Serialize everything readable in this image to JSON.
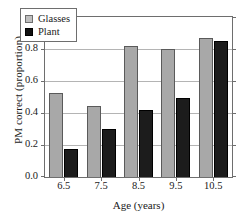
{
  "chart_data": {
    "type": "bar",
    "title": "",
    "xlabel": "Age (years)",
    "ylabel": "PM correct (proportion)",
    "categories": [
      "6.5",
      "7.5",
      "8.5",
      "9.5",
      "10.5"
    ],
    "series": [
      {
        "name": "Glasses",
        "color": "#a8a8a8",
        "values": [
          0.525,
          0.445,
          0.82,
          0.8,
          0.87
        ]
      },
      {
        "name": "Plant",
        "color": "#1c1c1c",
        "values": [
          0.175,
          0.3,
          0.42,
          0.495,
          0.85
        ]
      }
    ],
    "ylim": [
      0.0,
      1.0
    ],
    "yticks": [
      "1.0",
      "0.8",
      "0.6",
      "0.4",
      "0.2",
      "0.0"
    ],
    "ytick_values": [
      1.0,
      0.8,
      0.6,
      0.4,
      0.2,
      0.0
    ],
    "grid": true,
    "grid_axis": "y",
    "legend_position": "top-left",
    "legend": [
      "Glasses",
      "Plant"
    ]
  }
}
